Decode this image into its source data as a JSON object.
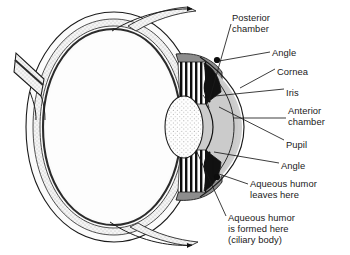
{
  "diagram": {
    "colors": {
      "outline": "#1a1a1a",
      "sclera": "#ffffff",
      "stipple_layer": "#efefef",
      "vitreous": "#f7f7f7",
      "iris_dark": "#111111",
      "ciliary_gray": "#8d8d8d",
      "anterior_chamber": "#cfcfcf",
      "lens": "#fdfdfd",
      "text": "#1a1a1a",
      "leader": "#1a1a1a"
    },
    "labels": [
      {
        "id": "posterior-chamber",
        "lines": [
          "Posterior",
          "chamber"
        ],
        "x": 232,
        "y": 12
      },
      {
        "id": "angle-top",
        "lines": [
          "Angle"
        ],
        "x": 272,
        "y": 47
      },
      {
        "id": "cornea",
        "lines": [
          "Cornea"
        ],
        "x": 277,
        "y": 66
      },
      {
        "id": "iris",
        "lines": [
          "Iris"
        ],
        "x": 286,
        "y": 87
      },
      {
        "id": "anterior-chamber",
        "lines": [
          "Anterior",
          "chamber"
        ],
        "x": 288,
        "y": 105
      },
      {
        "id": "pupil",
        "lines": [
          "Pupil"
        ],
        "x": 286,
        "y": 139
      },
      {
        "id": "angle-bottom",
        "lines": [
          "Angle"
        ],
        "x": 281,
        "y": 160
      },
      {
        "id": "aqueous-leaves",
        "lines": [
          "Aqueous humor",
          "leaves here"
        ],
        "x": 250,
        "y": 178
      },
      {
        "id": "aqueous-formed",
        "lines": [
          "Aqueous humor",
          "is formed here",
          "(ciliary body)"
        ],
        "x": 228,
        "y": 212
      }
    ],
    "structures": [
      "sclera",
      "choroid",
      "retina",
      "optic-nerve",
      "cornea",
      "iris",
      "pupil",
      "lens",
      "ciliary-body",
      "zonules",
      "anterior-chamber",
      "posterior-chamber",
      "vitreous-body",
      "muscle-tendon-superior",
      "muscle-tendon-inferior"
    ],
    "flow": {
      "description": "Arrows trace aqueous humor from the ciliary body through the posterior chamber, past the pupil into the anterior chamber, and out at the angle",
      "arrow_count": 4
    },
    "angle_markers": 2
  }
}
